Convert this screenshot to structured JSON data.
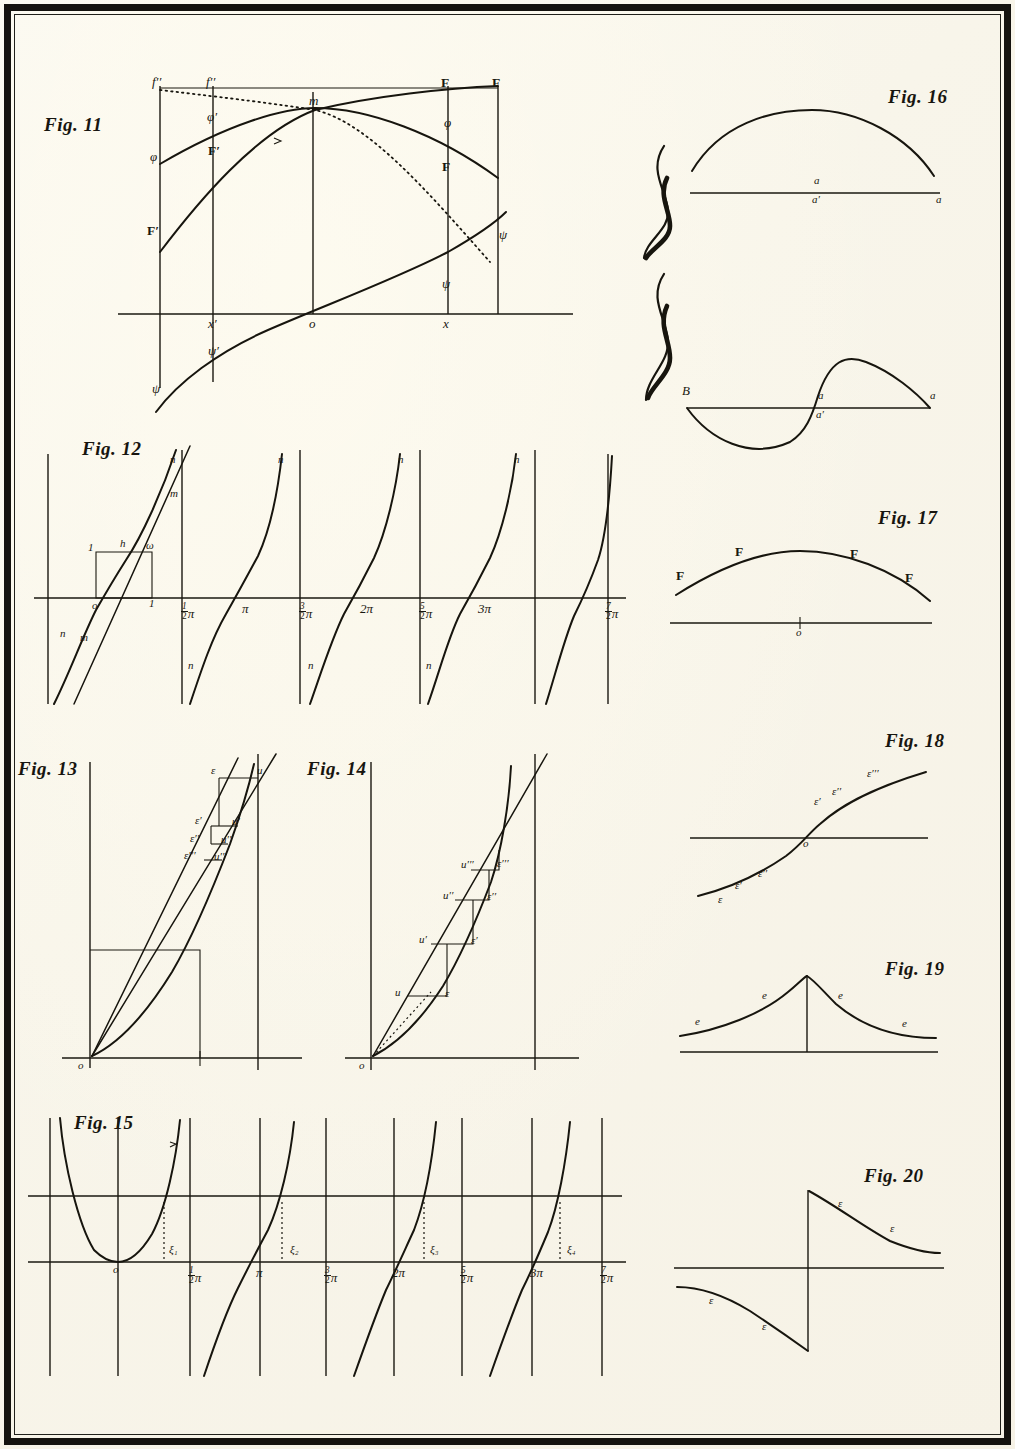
{
  "plate": {
    "domain": "historical-mathematics-plate",
    "background_color": "#faf7ec",
    "ink_color": "#17150e",
    "frame_color": "#15130f"
  },
  "figures": [
    {
      "id": "fig11",
      "caption": "Fig. 11",
      "description": "Axis with four ordinate verticals; bold F-curve rising, phi-curve arching over, dotted f''-curve descending, and psi-curve crossing origin.",
      "labels": {
        "f_upper_left": "f′′",
        "f_upper_left2": "f′′",
        "F_top_right": "F",
        "F_top_right2": "F",
        "phi_left": "φ",
        "phi_mid": "φ′",
        "phi_right": "φ",
        "F_left": "F′",
        "F_mid": "F′",
        "F_right": "F",
        "m": "m",
        "psi_low_left": "ψ",
        "psi_low_mid": "ψ′",
        "psi_right_low": "ψ",
        "psi_right_high": "ψ",
        "axis_x_left": "x′",
        "axis_origin": "o",
        "axis_x_right": "x"
      }
    },
    {
      "id": "fig12",
      "caption": "Fig. 12",
      "description": "Periodic tangent-like branches crossing the axis at multiples of pi, with a unit square construction at the origin.",
      "labels": {
        "origin": "o",
        "unit_left": "1",
        "unit_right": "1",
        "h": "h",
        "omega": "ω",
        "m_upper": "m",
        "m_lower": "m",
        "n_branch": "n"
      },
      "tick_labels": [
        {
          "num": "1",
          "den": "2",
          "sym": "π"
        },
        {
          "num": "",
          "den": "",
          "sym": "π"
        },
        {
          "num": "3",
          "den": "2",
          "sym": "π"
        },
        {
          "num": "",
          "den": "",
          "sym": "2π"
        },
        {
          "num": "5",
          "den": "2",
          "sym": "π"
        },
        {
          "num": "",
          "den": "",
          "sym": "3π"
        },
        {
          "num": "7",
          "den": "2",
          "sym": "π"
        }
      ]
    },
    {
      "id": "fig13",
      "caption": "Fig. 13",
      "description": "Convex curve with chord and successive small horizontal steps converging, labelled epsilon/u with increasing primes.",
      "labels": {
        "origin": "o",
        "eps": "ε",
        "u": "u",
        "eps1": "ε′",
        "u1": "u′",
        "eps2": "ε′′",
        "u2": "u′′",
        "eps3": "ε′′′",
        "u3": "u′′′"
      }
    },
    {
      "id": "fig14",
      "caption": "Fig. 14",
      "description": "Convex curve with secant line and staircase construction of decreasing rectangles labelled u/epsilon with primes.",
      "labels": {
        "origin": "o",
        "u": "u",
        "eps": "ε",
        "u1": "u′",
        "eps1": "ε′",
        "u2": "u′′",
        "eps2": "ε′′",
        "u3": "u′′′",
        "eps3": "ε′′′"
      }
    },
    {
      "id": "fig15",
      "caption": "Fig. 15",
      "description": "Periodic branches with a horizontal secant line cutting each branch; the abscissa differences are marked xi with subscripts.",
      "labels": {
        "origin": "o",
        "xi1": "ξ₁",
        "xi2": "ξ₂",
        "xi3": "ξ₃",
        "xi4": "ξ₄"
      },
      "tick_labels": [
        {
          "num": "1",
          "den": "2",
          "sym": "π"
        },
        {
          "num": "",
          "den": "",
          "sym": "π"
        },
        {
          "num": "3",
          "den": "2",
          "sym": "π"
        },
        {
          "num": "",
          "den": "",
          "sym": "2π"
        },
        {
          "num": "5",
          "den": "2",
          "sym": "π"
        },
        {
          "num": "",
          "den": "",
          "sym": "3π"
        },
        {
          "num": "7",
          "den": "2",
          "sym": "π"
        }
      ]
    },
    {
      "id": "fig16",
      "caption": "Fig. 16",
      "description": "Two panels joined by a large brace: an upper single arch over a base line, and a lower S-shaped curve crossing its base line.",
      "labels": {
        "upper_a_above": "a",
        "upper_a_below": "a′",
        "upper_right": "a",
        "lower_B": "B",
        "lower_a_above": "a",
        "lower_a_below": "a′",
        "lower_right": "a"
      }
    },
    {
      "id": "fig17",
      "caption": "Fig. 17",
      "description": "Single shallow arch above a base line, marked with four bold F labels; the base line carries a small tick at o.",
      "labels": {
        "F1": "F",
        "F2": "F",
        "F3": "F",
        "F4": "F",
        "origin": "o"
      }
    },
    {
      "id": "fig18",
      "caption": "Fig. 18",
      "description": "Monotone sigmoid curve crossing the horizontal axis at o, with epsilon labels along both branches.",
      "labels": {
        "origin": "o",
        "e1": "ε",
        "e2": "ε′",
        "e3": "ε′′",
        "e4": "ε′",
        "e5": "ε′′",
        "e6": "ε′′′"
      }
    },
    {
      "id": "fig19",
      "caption": "Fig. 19",
      "description": "Symmetric cusped peak over a base line with a central ordinate; decaying tails labelled e on both sides.",
      "labels": {
        "e1": "e",
        "e2": "e",
        "e3": "e",
        "e4": "e"
      }
    },
    {
      "id": "fig20",
      "caption": "Fig. 20",
      "description": "Discontinuous hyperbola-like curve with a vertical asymptote: upper-right decaying branch and lower-left branch, labelled epsilon.",
      "labels": {
        "e1": "ε",
        "e2": "ε",
        "e3": "ε",
        "e4": "ε"
      }
    }
  ]
}
